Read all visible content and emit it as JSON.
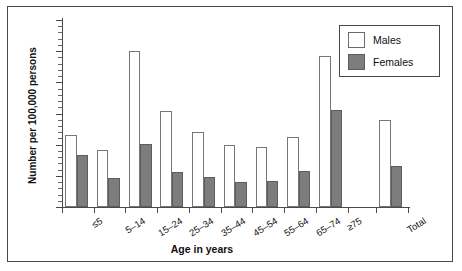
{
  "chart_data": {
    "type": "bar",
    "title": "",
    "xlabel": "Age in years",
    "ylabel": "Number per 100,000 persons",
    "ylim": [
      0,
      300
    ],
    "ytick_labels": [
      "0",
      "50",
      "100",
      "150",
      "200",
      "250",
      "300"
    ],
    "ytick_values": [
      0,
      50,
      100,
      150,
      200,
      250,
      300
    ],
    "yminor_step": 10,
    "grid": false,
    "legend_position": "top-right",
    "categories": [
      "≤5",
      "5–14",
      "15–24",
      "25–34",
      "35–44",
      "45–54",
      "55–64",
      "65–74",
      "≥75",
      "Total"
    ],
    "series": [
      {
        "name": "Males",
        "color": "#ffffff",
        "edge_color": "#777777",
        "values": [
          115,
          91,
          250,
          154,
          120,
          99,
          96,
          113,
          243,
          140
        ]
      },
      {
        "name": "Females",
        "color": "#7d7d7d",
        "edge_color": "#5d5d5d",
        "values": [
          84,
          47,
          101,
          56,
          48,
          40,
          42,
          57,
          155,
          66
        ]
      }
    ],
    "gap_before_total": true
  },
  "legend": {
    "items": [
      {
        "label": "Males",
        "swatch": "male-swatch"
      },
      {
        "label": "Females",
        "swatch": "female-swatch"
      }
    ]
  },
  "axes": {
    "x_title": "Age in years",
    "y_title": "Number per 100,000 persons"
  },
  "colors": {
    "frame": "#4a4a4a",
    "axis": "#4a4a4a",
    "male_fill": "#ffffff",
    "female_fill": "#7d7d7d",
    "text": "#111111",
    "background": "#ffffff"
  }
}
